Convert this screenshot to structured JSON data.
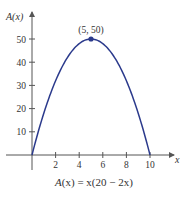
{
  "chart_data": {
    "type": "line",
    "title": "",
    "caption": "A(x) = x(20 − 2x)",
    "function": "A(x) = x(20 - 2x)",
    "xlabel": "x",
    "ylabel": "A(x)",
    "xlim": [
      0,
      10.8
    ],
    "ylim": [
      0,
      58
    ],
    "x_ticks": [
      2,
      4,
      6,
      8,
      10
    ],
    "y_ticks": [
      10,
      20,
      30,
      40,
      50
    ],
    "grid": false,
    "legend": null,
    "series": [
      {
        "name": "A(x)",
        "color": "#2b3a8c",
        "x": [
          0,
          1,
          2,
          3,
          4,
          5,
          6,
          7,
          8,
          9,
          10
        ],
        "y": [
          0,
          18,
          32,
          42,
          48,
          50,
          48,
          42,
          32,
          18,
          0
        ]
      }
    ],
    "annotations": [
      {
        "x": 5,
        "y": 50,
        "label": "(5, 50)",
        "marker": "dot"
      }
    ]
  },
  "labels": {
    "x_axis": "x",
    "y_axis": "A(x)",
    "point": "(5, 50)",
    "caption_lhs": "A",
    "caption_rhs": "(x) = x(20 − 2x)"
  },
  "colors": {
    "curve": "#2b3a8c",
    "axis": "#555555",
    "text": "#333333"
  }
}
